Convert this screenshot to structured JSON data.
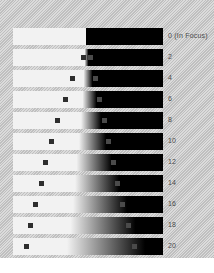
{
  "chart_data": {
    "type": "bar",
    "xlabel": "",
    "ylabel": "Blur amount",
    "grid": false,
    "legend": null,
    "categories": [
      "0",
      "2",
      "4",
      "6",
      "8",
      "10",
      "12",
      "14",
      "16",
      "18",
      "20"
    ],
    "tick_labels": [
      "0  (In Focus)",
      "2",
      "4",
      "6",
      "8",
      "10",
      "12",
      "14",
      "16",
      "18",
      "20"
    ],
    "series": [
      {
        "name": "blur_radius_px",
        "values": [
          0,
          4,
          9,
          14,
          20,
          27,
          35,
          44,
          54,
          65,
          78
        ]
      },
      {
        "name": "edge_center_pct",
        "values": [
          49,
          49,
          50,
          51,
          52,
          53,
          54,
          56,
          58,
          60,
          62
        ]
      },
      {
        "name": "marker_left_pct",
        "values": [
          null,
          45,
          38,
          33,
          28,
          24,
          20,
          17,
          13,
          10,
          7
        ]
      },
      {
        "name": "marker_right_pct",
        "values": [
          null,
          50,
          53,
          56,
          59,
          62,
          65,
          68,
          71,
          75,
          79
        ]
      }
    ],
    "rows": [
      {
        "label": "0  (In Focus)",
        "value": 0,
        "blur": 0,
        "edge": 49,
        "marker_left": null,
        "marker_right": null
      },
      {
        "label": "2",
        "value": 2,
        "blur": 4,
        "edge": 49,
        "marker_left": 45,
        "marker_right": 50
      },
      {
        "label": "4",
        "value": 4,
        "blur": 9,
        "edge": 50,
        "marker_left": 38,
        "marker_right": 53
      },
      {
        "label": "6",
        "value": 6,
        "blur": 14,
        "edge": 51,
        "marker_left": 33,
        "marker_right": 56
      },
      {
        "label": "8",
        "value": 8,
        "blur": 20,
        "edge": 52,
        "marker_left": 28,
        "marker_right": 59
      },
      {
        "label": "10",
        "value": 10,
        "blur": 27,
        "edge": 53,
        "marker_left": 24,
        "marker_right": 62
      },
      {
        "label": "12",
        "value": 12,
        "blur": 35,
        "edge": 54,
        "marker_left": 20,
        "marker_right": 65
      },
      {
        "label": "14",
        "value": 14,
        "blur": 44,
        "edge": 56,
        "marker_left": 17,
        "marker_right": 68
      },
      {
        "label": "16",
        "value": 16,
        "blur": 54,
        "edge": 58,
        "marker_left": 13,
        "marker_right": 71
      },
      {
        "label": "18",
        "value": 18,
        "blur": 65,
        "edge": 60,
        "marker_left": 10,
        "marker_right": 75
      },
      {
        "label": "20",
        "value": 20,
        "blur": 78,
        "edge": 62,
        "marker_left": 7,
        "marker_right": 79
      }
    ],
    "colors": {
      "gradient_light": "#f2f2f2",
      "gradient_dark": "#000000",
      "marker": "#2e2e2e",
      "background": "#c9c9c9",
      "label_text": "#4a4a4a",
      "row_gap": "#ffffff"
    },
    "geometry": {
      "row_top_start": 28,
      "row_pitch": 21,
      "row_height": 17,
      "bar_left": 13,
      "bar_width": 150,
      "label_left": 168
    }
  }
}
